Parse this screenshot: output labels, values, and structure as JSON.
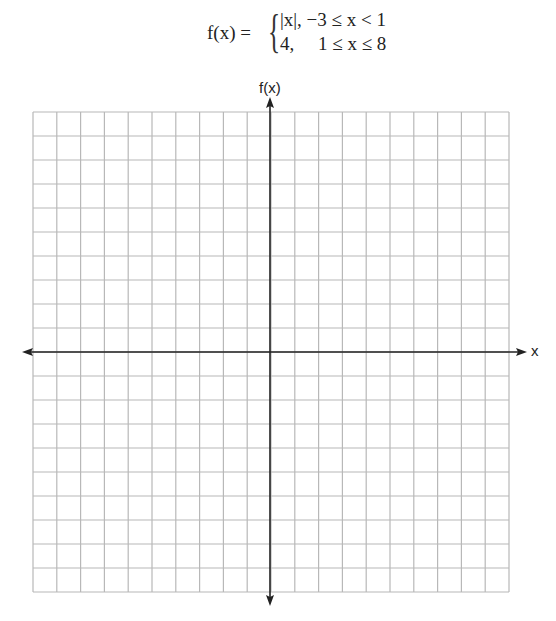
{
  "formula": {
    "lhs": "f(x) =",
    "cases": [
      {
        "expr": "|x|,",
        "condition": "−3 ≤ x < 1"
      },
      {
        "expr": "4,",
        "condition": "1 ≤ x ≤ 8"
      }
    ]
  },
  "graph": {
    "grid_columns": 20,
    "grid_rows": 20,
    "y_axis_label": "f(x)",
    "x_axis_label": "x",
    "grid_color": "#b8b8b8",
    "axis_color": "#222222"
  }
}
